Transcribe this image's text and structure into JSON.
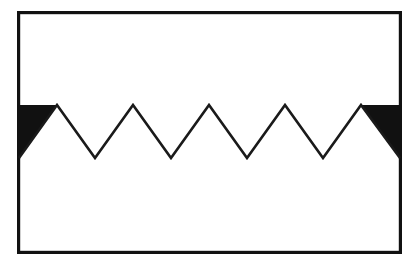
{
  "figure": {
    "title": "Zigzag sawtooth pattern inside rectangular frame",
    "canvas": {
      "width": 418,
      "height": 274,
      "background_color": "#FFFFFF"
    },
    "frame": {
      "name": "rectangular-border",
      "x": 17,
      "y": 11,
      "width": 385,
      "height": 243,
      "stroke_color": "#111111",
      "stroke_width": 3.2,
      "fill_color": "#FFFFFF"
    },
    "zigzag": {
      "name": "sawtooth-polyline",
      "stroke_color": "#1A1A1A",
      "stroke_width": 2.6,
      "peak_y": 105,
      "valley_y": 158,
      "period": 76,
      "peak_count": 5,
      "valley_count": 4,
      "peaks_x": [
        57,
        133,
        209,
        285,
        361
      ],
      "valleys_x": [
        95,
        171,
        247,
        323
      ],
      "points": "57,105 95,158 133,105 171,158 209,105 247,158 285,105 323,158 361,105",
      "full_path": "M 19,158 L 57,105 L 95,158 L 133,105 L 171,158 L 209,105 L 247,158 L 285,105 L 323,158 L 361,105 L 400,158"
    },
    "shaded_regions": [
      {
        "name": "left-filled-triangle",
        "fill_color": "#111111",
        "points": "19,105 57,105 19,158",
        "description": "Solid black right triangle at left edge above the first rising stroke"
      },
      {
        "name": "right-filled-triangle",
        "fill_color": "#111111",
        "points": "361,105 400,105 400,158",
        "description": "Solid black right triangle at right edge above the last falling stroke"
      }
    ],
    "colors": {
      "ink": "#111111",
      "paper": "#FFFFFF"
    }
  }
}
